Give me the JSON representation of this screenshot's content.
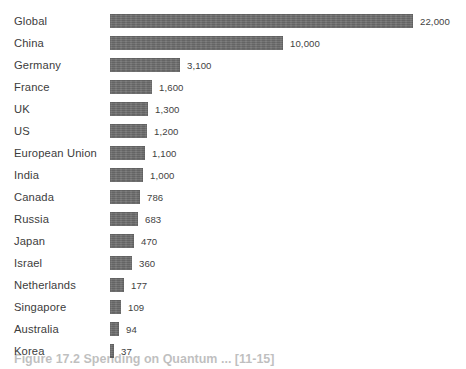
{
  "figure": {
    "caption": "Figure 17.2 Spending on Quantum ... [11-15]",
    "background_color": "#ffffff",
    "bar_color": "#6d6d6d",
    "text_color": "#3c3c3c"
  },
  "chart_data": {
    "type": "bar",
    "orientation": "horizontal",
    "title": "",
    "subtitle": "",
    "xlabel": "",
    "ylabel": "",
    "grid": false,
    "legend": null,
    "axis_visible": false,
    "scale_note": "bar lengths are drawn on a compressed (non-linear) scale",
    "categories": [
      "Global",
      "China",
      "Germany",
      "France",
      "UK",
      "US",
      "European Union",
      "India",
      "Canada",
      "Russia",
      "Japan",
      "Israel",
      "Netherlands",
      "Singapore",
      "Australia",
      "Korea"
    ],
    "values": [
      22000,
      10000,
      3100,
      1600,
      1300,
      1200,
      1100,
      1000,
      786,
      683,
      470,
      360,
      177,
      109,
      94,
      37
    ],
    "value_labels": [
      "22,000",
      "10,000",
      "3,100",
      "1,600",
      "1,300",
      "1,200",
      "1,100",
      "1,000",
      "786",
      "683",
      "470",
      "360",
      "177",
      "109",
      "94",
      "37"
    ],
    "bar_pixel_widths": [
      303,
      173,
      70,
      42,
      38,
      37,
      35,
      33,
      30,
      28,
      24,
      22,
      14,
      11,
      9,
      4
    ],
    "rows": [
      {
        "label": "Global",
        "value": 22000,
        "value_label": "22,000",
        "bar_px": 303
      },
      {
        "label": "China",
        "value": 10000,
        "value_label": "10,000",
        "bar_px": 173
      },
      {
        "label": "Germany",
        "value": 3100,
        "value_label": "3,100",
        "bar_px": 70
      },
      {
        "label": "France",
        "value": 1600,
        "value_label": "1,600",
        "bar_px": 42
      },
      {
        "label": "UK",
        "value": 1300,
        "value_label": "1,300",
        "bar_px": 38
      },
      {
        "label": "US",
        "value": 1200,
        "value_label": "1,200",
        "bar_px": 37
      },
      {
        "label": "European Union",
        "value": 1100,
        "value_label": "1,100",
        "bar_px": 35
      },
      {
        "label": "India",
        "value": 1000,
        "value_label": "1,000",
        "bar_px": 33
      },
      {
        "label": "Canada",
        "value": 786,
        "value_label": "786",
        "bar_px": 30
      },
      {
        "label": "Russia",
        "value": 683,
        "value_label": "683",
        "bar_px": 28
      },
      {
        "label": "Japan",
        "value": 470,
        "value_label": "470",
        "bar_px": 24
      },
      {
        "label": "Israel",
        "value": 360,
        "value_label": "360",
        "bar_px": 22
      },
      {
        "label": "Netherlands",
        "value": 177,
        "value_label": "177",
        "bar_px": 14
      },
      {
        "label": "Singapore",
        "value": 109,
        "value_label": "109",
        "bar_px": 11
      },
      {
        "label": "Australia",
        "value": 94,
        "value_label": "94",
        "bar_px": 9
      },
      {
        "label": "Korea",
        "value": 37,
        "value_label": "37",
        "bar_px": 4
      }
    ]
  }
}
